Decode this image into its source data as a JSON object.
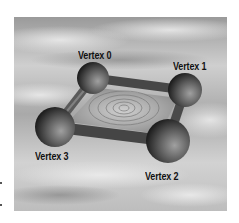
{
  "figure": {
    "vertices": [
      {
        "id": 0,
        "label": "Vertex 0",
        "cx": 93,
        "cy": 78,
        "r": 16
      },
      {
        "id": 1,
        "label": "Vertex 1",
        "cx": 185,
        "cy": 90,
        "r": 17
      },
      {
        "id": 2,
        "label": "Vertex 2",
        "cx": 168,
        "cy": 141,
        "r": 22
      },
      {
        "id": 3,
        "label": "Vertex 3",
        "cx": 55,
        "cy": 127,
        "r": 20
      }
    ],
    "edges": [
      [
        0,
        1
      ],
      [
        1,
        2
      ],
      [
        2,
        3
      ],
      [
        3,
        0
      ]
    ],
    "colors": {
      "sky_light": "#d9d9d9",
      "sky_dark": "#8c8c8c",
      "sphere_dark": "#2a2a2a",
      "sphere_light": "#9a9a9a",
      "edge": "#4a4a4a",
      "face": "#a8a8a8",
      "label": "#111111"
    }
  }
}
